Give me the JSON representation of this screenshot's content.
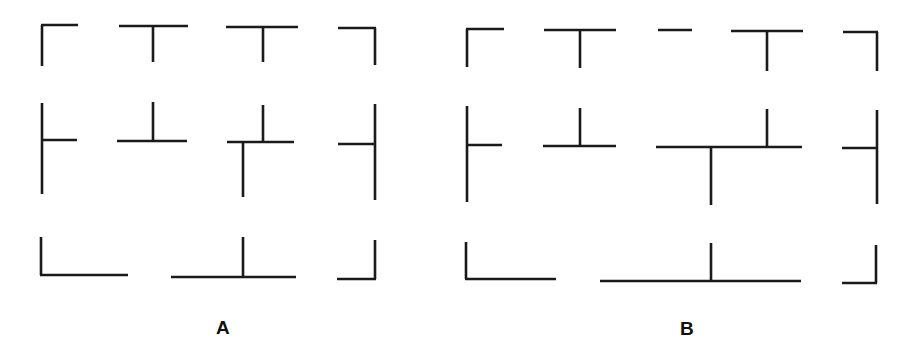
{
  "figures": [
    {
      "id": "A",
      "label": "A",
      "label_pos": [
        216,
        318
      ],
      "pieces": [
        {
          "name": "corner-top-left",
          "segments": [
            [
              42,
              25,
              42,
              66
            ],
            [
              41,
              25,
              78,
              25
            ]
          ]
        },
        {
          "name": "tee-top-1",
          "segments": [
            [
              119,
              26,
              188,
              26
            ],
            [
              153,
              26,
              153,
              62
            ]
          ]
        },
        {
          "name": "tee-top-2",
          "segments": [
            [
              226,
              27,
              298,
              27
            ],
            [
              263,
              27,
              263,
              62
            ]
          ]
        },
        {
          "name": "corner-top-right",
          "segments": [
            [
              338,
              28,
              376,
              28
            ],
            [
              375,
              28,
              375,
              65
            ]
          ]
        },
        {
          "name": "tee-left-middle",
          "segments": [
            [
              42,
              103,
              42,
              194
            ],
            [
              42,
              140,
              77,
              140
            ]
          ]
        },
        {
          "name": "tee-inverted-middle-1",
          "segments": [
            [
              153,
              102,
              153,
              141
            ],
            [
              117,
              141,
              187,
              141
            ]
          ]
        },
        {
          "name": "cross-offset-middle",
          "segments": [
            [
              227,
              142,
              294,
              142
            ],
            [
              263,
              105,
              263,
              142
            ],
            [
              243,
              142,
              243,
              197
            ]
          ]
        },
        {
          "name": "tee-right-middle",
          "segments": [
            [
              375,
              104,
              375,
              200
            ],
            [
              338,
              144,
              375,
              144
            ]
          ]
        },
        {
          "name": "corner-bottom-left",
          "segments": [
            [
              41,
              237,
              41,
              275
            ],
            [
              40,
              275,
              128,
              275
            ]
          ]
        },
        {
          "name": "tee-inverted-bottom",
          "segments": [
            [
              171,
              277,
              296,
              277
            ],
            [
              243,
              237,
              243,
              277
            ]
          ]
        },
        {
          "name": "corner-bottom-right",
          "segments": [
            [
              375,
              240,
              375,
              279
            ],
            [
              337,
              279,
              376,
              279
            ]
          ]
        }
      ]
    },
    {
      "id": "B",
      "label": "B",
      "label_pos": [
        680,
        319
      ],
      "pieces": [
        {
          "name": "corner-top-left",
          "segments": [
            [
              467,
              29,
              467,
              67
            ],
            [
              466,
              29,
              504,
              29
            ]
          ]
        },
        {
          "name": "tee-top-1",
          "segments": [
            [
              544,
              30,
              616,
              30
            ],
            [
              580,
              30,
              580,
              68
            ]
          ]
        },
        {
          "name": "dash-top",
          "segments": [
            [
              658,
              30,
              692,
              30
            ]
          ]
        },
        {
          "name": "tee-top-2",
          "segments": [
            [
              731,
              31,
              803,
              31
            ],
            [
              767,
              31,
              767,
              71
            ]
          ]
        },
        {
          "name": "corner-top-right",
          "segments": [
            [
              843,
              32,
              878,
              32
            ],
            [
              877,
              32,
              877,
              71
            ]
          ]
        },
        {
          "name": "tee-left-middle",
          "segments": [
            [
              467,
              106,
              467,
              202
            ],
            [
              467,
              145,
              502,
              145
            ]
          ]
        },
        {
          "name": "tee-inverted-middle-1",
          "segments": [
            [
              580,
              108,
              580,
              146
            ],
            [
              543,
              146,
              616,
              146
            ]
          ]
        },
        {
          "name": "long-bar-middle",
          "segments": [
            [
              656,
              147,
              802,
              147
            ],
            [
              767,
              109,
              767,
              148
            ],
            [
              711,
              147,
              711,
              205
            ]
          ]
        },
        {
          "name": "tee-right-middle",
          "segments": [
            [
              877,
              110,
              877,
              204
            ],
            [
              842,
              148,
              877,
              148
            ]
          ]
        },
        {
          "name": "corner-bottom-left",
          "segments": [
            [
              466,
              242,
              466,
              279
            ],
            [
              465,
              279,
              556,
              279
            ]
          ]
        },
        {
          "name": "long-tee-inverted-bottom",
          "segments": [
            [
              600,
              281,
              801,
              281
            ],
            [
              711,
              243,
              711,
              281
            ]
          ]
        },
        {
          "name": "corner-bottom-right",
          "segments": [
            [
              876,
              245,
              876,
              283
            ],
            [
              842,
              283,
              877,
              283
            ]
          ]
        }
      ]
    }
  ]
}
